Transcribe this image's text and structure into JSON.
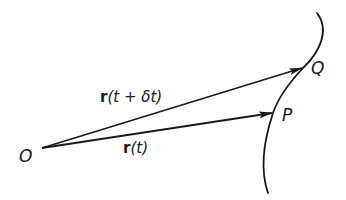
{
  "diagram": {
    "colors": {
      "ink": "#1a1a1a",
      "background": "#ffffff"
    },
    "points": {
      "origin": {
        "label": "O",
        "x": 42,
        "y": 148
      },
      "P": {
        "label": "P",
        "x": 273,
        "y": 113
      },
      "Q": {
        "label": "Q",
        "x": 303,
        "y": 68
      }
    },
    "vectors": [
      {
        "from": "O",
        "to": "Q",
        "label_symbol": "r",
        "label_args": "(t + δt)",
        "label_full": "r(t + δt)"
      },
      {
        "from": "O",
        "to": "P",
        "label_symbol": "r",
        "label_args": "(t)",
        "label_full": "r(t)"
      }
    ],
    "curve": {
      "description": "smooth curve passing through Q and P",
      "path": "M 317 13 C 330 30, 320 52, 303 68 C 288 84, 278 98, 273 113 C 264 140, 260 170, 268 193"
    }
  }
}
